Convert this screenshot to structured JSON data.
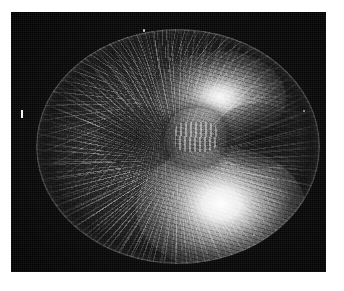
{
  "figure": {
    "kind": "fluorescence-micrograph",
    "caption": "",
    "alt_text": "Grayscale fluorescence micrograph of a dividing cell showing a bipolar mitotic spindle with two bright astral poles and radiating microtubule fibres",
    "background_color": "#ffffff",
    "plate_color": "#070707",
    "signal_color": "#ffffff"
  },
  "plate": {
    "label": "photographic plate",
    "x": 11,
    "y": 12,
    "width": 315,
    "height": 260
  },
  "specimen": {
    "label": "cell",
    "shape": "oblate ellipse",
    "center_x": 167,
    "center_y": 134,
    "width": 284,
    "height": 235
  },
  "features": [
    {
      "name": "upper-aster",
      "label": "upper spindle pole (aster)",
      "center_x": 184,
      "center_y": 68,
      "brightness": "bright"
    },
    {
      "name": "lower-aster",
      "label": "lower spindle pole (aster)",
      "center_x": 185,
      "center_y": 180,
      "brightness": "brightest"
    },
    {
      "name": "chromosome-mass",
      "label": "chromosome / nuclear mass",
      "center_x": 160,
      "center_y": 108,
      "brightness": "dark"
    },
    {
      "name": "astral-rays",
      "label": "radiating microtubule fibres",
      "brightness": "mid"
    },
    {
      "name": "cell-cortex",
      "label": "cortical rim",
      "brightness": "mid"
    }
  ],
  "annotations": {
    "scale_bar": {
      "label": "scale bar",
      "orientation": "vertical",
      "text": ""
    },
    "specks": [
      {
        "name": "speck-top",
        "label": "emulsion speck"
      },
      {
        "name": "speck-right",
        "label": "emulsion speck"
      },
      {
        "name": "speck-bottom",
        "label": "emulsion speck"
      }
    ]
  }
}
